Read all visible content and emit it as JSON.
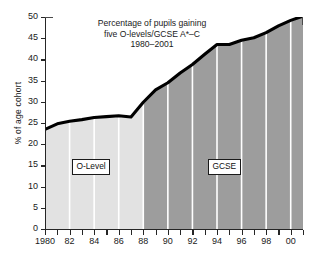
{
  "chart_data": {
    "type": "area",
    "title_lines": [
      "Percentage of pupils gaining",
      "five O-levels/GCSE A*–C",
      "1980–2001"
    ],
    "xlabel": "",
    "ylabel": "% of age cohort",
    "ylim": [
      0,
      50
    ],
    "xlim": [
      1980,
      2001
    ],
    "yticks": [
      0,
      5,
      10,
      15,
      20,
      25,
      30,
      35,
      40,
      45,
      50
    ],
    "ytick_labels": [
      "0",
      "5",
      "10",
      "15",
      "20",
      "25",
      "30",
      "35",
      "40",
      "45",
      "50"
    ],
    "xticks": [
      1980,
      1981,
      1982,
      1983,
      1984,
      1985,
      1986,
      1987,
      1988,
      1989,
      1990,
      1991,
      1992,
      1993,
      1994,
      1995,
      1996,
      1997,
      1998,
      1999,
      2000,
      2001
    ],
    "xtick_labels": [
      "1980",
      "",
      "82",
      "",
      "84",
      "",
      "86",
      "",
      "88",
      "",
      "90",
      "",
      "92",
      "",
      "94",
      "",
      "96",
      "",
      "98",
      "",
      "00",
      ""
    ],
    "grid": "vertical-white-every-2-years",
    "legend_position": "inline-annotations",
    "x": [
      1980,
      1981,
      1982,
      1983,
      1984,
      1985,
      1986,
      1987,
      1988,
      1989,
      1990,
      1991,
      1992,
      1993,
      1994,
      1995,
      1996,
      1997,
      1998,
      1999,
      2000,
      2001
    ],
    "values": [
      23.5,
      24.8,
      25.4,
      25.8,
      26.3,
      26.5,
      26.7,
      26.4,
      29.9,
      32.8,
      34.5,
      36.8,
      38.8,
      41.2,
      43.5,
      43.5,
      44.5,
      45.1,
      46.3,
      47.9,
      49.2,
      50.2
    ],
    "series": [
      {
        "name": "% of age cohort gaining five O-levels/GCSE A*–C",
        "values": [
          23.5,
          24.8,
          25.4,
          25.8,
          26.3,
          26.5,
          26.7,
          26.4,
          29.9,
          32.8,
          34.5,
          36.8,
          38.8,
          41.2,
          43.5,
          43.5,
          44.5,
          45.1,
          46.3,
          47.9,
          49.2,
          50.2
        ]
      }
    ],
    "regions": [
      {
        "label": "O-Level",
        "x_start": 1980,
        "x_end": 1988,
        "fill": "#e2e2e2"
      },
      {
        "label": "GCSE",
        "x_start": 1988,
        "x_end": 2001,
        "fill": "#9d9d9d"
      }
    ],
    "annotations": [
      {
        "text": "O-Level",
        "x": 1983,
        "y": 14
      },
      {
        "text": "GCSE",
        "x": 1994.5,
        "y": 14
      }
    ],
    "colors": {
      "line": "#000000",
      "olevel_fill": "#e2e2e2",
      "gcse_fill": "#9d9d9d",
      "gridline": "#ffffff",
      "axis": "#262626",
      "text": "#1a1a1a",
      "background": "#ffffff"
    }
  }
}
